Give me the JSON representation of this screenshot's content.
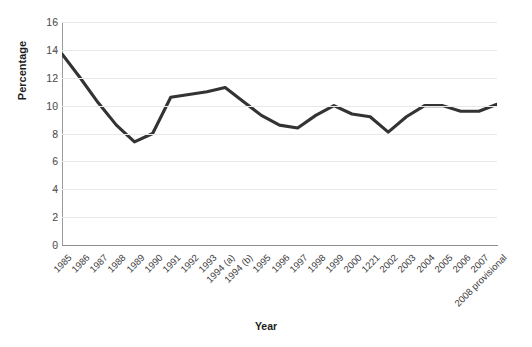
{
  "chart_data": {
    "type": "line",
    "title": "",
    "xlabel": "Year",
    "ylabel": "Percentage",
    "ylim": [
      0,
      16
    ],
    "ytick_step": 2,
    "yticks": [
      16,
      14,
      12,
      10,
      8,
      6,
      4,
      2,
      0
    ],
    "grid": true,
    "legend": "none",
    "line_color": "#333333",
    "grid_color": "#e8e8e8",
    "axis_color": "#9a9a9a",
    "categories": [
      "1985",
      "1986",
      "1987",
      "1988",
      "1989",
      "1990",
      "1991",
      "1992",
      "1993",
      "1994 (a)",
      "1994 (b)",
      "1995",
      "1996",
      "1997",
      "1998",
      "1999",
      "2000",
      "1221",
      "2002",
      "2003",
      "2004",
      "2005",
      "2006",
      "2007",
      "2008 provisional"
    ],
    "series": [
      {
        "name": "Percentage",
        "values": [
          13.7,
          12.0,
          10.2,
          8.6,
          7.4,
          8.0,
          10.6,
          10.8,
          11.0,
          11.3,
          10.3,
          9.3,
          8.6,
          8.4,
          9.3,
          10.0,
          9.4,
          9.2,
          8.1,
          9.2,
          10.0,
          10.0,
          9.6,
          9.6,
          10.1
        ]
      }
    ]
  },
  "axes": {
    "x_title": "Year",
    "y_title": "Percentage"
  }
}
